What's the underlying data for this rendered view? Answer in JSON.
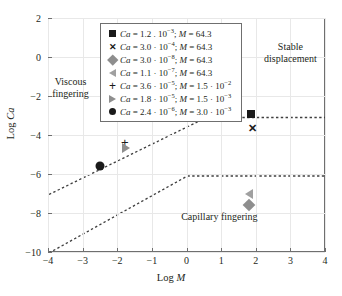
{
  "chart_data": {
    "type": "scatter",
    "title": "",
    "xlabel": "Log M",
    "ylabel": "Log Ca",
    "xlim": [
      -4,
      4
    ],
    "ylim": [
      -10,
      2
    ],
    "xticks": [
      "-4",
      "-3",
      "-2",
      "-1",
      "0",
      "1",
      "2",
      "3",
      "4"
    ],
    "xtick_values": [
      -4,
      -3,
      -2,
      -1,
      0,
      1,
      2,
      3,
      4
    ],
    "yticks": [
      "2",
      "0",
      "-2",
      "-4",
      "-6",
      "-8",
      "-10"
    ],
    "ytick_values": [
      2,
      0,
      -2,
      -4,
      -6,
      -8,
      -10
    ],
    "grid": true,
    "legend_position": "top-center",
    "series": [
      {
        "name": "series-square",
        "marker": "square",
        "color": "#1a1a1a",
        "x": 1.85,
        "y": -2.9
      },
      {
        "name": "series-cross",
        "marker": "cross",
        "color": "#1a1a1a",
        "x": 1.92,
        "y": -3.65
      },
      {
        "name": "series-diamond",
        "marker": "diamond",
        "color": "#8e8e8e",
        "x": 1.8,
        "y": -7.6
      },
      {
        "name": "series-ltri",
        "marker": "left-triangle",
        "color": "#a0a0a0",
        "x": 1.8,
        "y": -7.0
      },
      {
        "name": "series-plus",
        "marker": "plus",
        "color": "#1a1a1a",
        "x": -1.78,
        "y": -4.35
      },
      {
        "name": "series-rtri",
        "marker": "right-triangle",
        "color": "#8e8e8e",
        "x": -1.75,
        "y": -4.68
      },
      {
        "name": "series-circle",
        "marker": "circle",
        "color": "#1a1a1a",
        "x": -2.5,
        "y": -5.6
      }
    ],
    "boundaries": [
      {
        "name": "upper-boundary",
        "points": [
          [
            -4,
            -7.0
          ],
          [
            0.55,
            -3.05
          ],
          [
            4,
            -3.05
          ]
        ],
        "style": "dashed"
      },
      {
        "name": "lower-boundary",
        "points": [
          [
            -4,
            -10.0
          ],
          [
            0.0,
            -6.05
          ],
          [
            4,
            -6.05
          ]
        ],
        "style": "dashed"
      }
    ],
    "annotations": [
      {
        "name": "viscous-fingering",
        "text": "Viscous\nfingering",
        "line1": "Viscous",
        "line2": "fingering",
        "x": -3.35,
        "y": -1.55
      },
      {
        "name": "stable-displacement",
        "text": "Stable\ndisplacement",
        "line1": "Stable",
        "line2": "displacement",
        "x": 3.0,
        "y": 0.25
      },
      {
        "name": "capillary-fingering",
        "text": "Capillary fingering",
        "line1": "Capillary fingering",
        "line2": "",
        "x": 0.95,
        "y": -8.2
      }
    ]
  },
  "axes": {
    "x_title_prefix": "Log ",
    "x_title_symbol": "M",
    "y_title_prefix": "Log ",
    "y_title_symbol": "Ca"
  },
  "legend": {
    "entries": [
      {
        "marker": "square",
        "ca_symbol": "Ca",
        "ca_eq": " = 1.2 . 10",
        "ca_exp": "−3",
        "sep": "; ",
        "m_symbol": "M",
        "m_eq": " = 64.3",
        "m_exp": "",
        "m_tail": ""
      },
      {
        "marker": "cross",
        "ca_symbol": "Ca",
        "ca_eq": " = 3.0 · 10",
        "ca_exp": "−4",
        "sep": "; ",
        "m_symbol": "M",
        "m_eq": " = 64.3",
        "m_exp": "",
        "m_tail": ""
      },
      {
        "marker": "diamond",
        "ca_symbol": "Ca",
        "ca_eq": " = 3.0 · 10",
        "ca_exp": "−8",
        "sep": "; ",
        "m_symbol": "M",
        "m_eq": " = 64.3",
        "m_exp": "",
        "m_tail": ""
      },
      {
        "marker": "left-triangle",
        "ca_symbol": "Ca",
        "ca_eq": " = 1.1 · 10",
        "ca_exp": "−7",
        "sep": "; ",
        "m_symbol": "M",
        "m_eq": " = 64.3",
        "m_exp": "",
        "m_tail": ""
      },
      {
        "marker": "plus",
        "ca_symbol": "Ca",
        "ca_eq": " = 3.6 · 10",
        "ca_exp": "−5",
        "sep": "; ",
        "m_symbol": "M",
        "m_eq": " = 1.5 · 10",
        "m_exp": "−2",
        "m_tail": ""
      },
      {
        "marker": "right-triangle",
        "ca_symbol": "Ca",
        "ca_eq": " = 1.8 · 10",
        "ca_exp": "−5",
        "sep": "; ",
        "m_symbol": "M",
        "m_eq": " = 1.5 · 10",
        "m_exp": "−3",
        "m_tail": ""
      },
      {
        "marker": "circle",
        "ca_symbol": "Ca",
        "ca_eq": " = 2.4 · 10",
        "ca_exp": "−6",
        "sep": "; ",
        "m_symbol": "M",
        "m_eq": " = 3.0 · 10",
        "m_exp": "−3",
        "m_tail": ""
      }
    ]
  },
  "colors": {
    "frame": "#6f6f6f",
    "grid": "#e8e8e8",
    "dark_marker": "#1a1a1a",
    "gray_marker": "#8e8e8e",
    "light_gray_marker": "#a0a0a0",
    "dash_line": "#3f3f3f",
    "text": "#231f20"
  }
}
